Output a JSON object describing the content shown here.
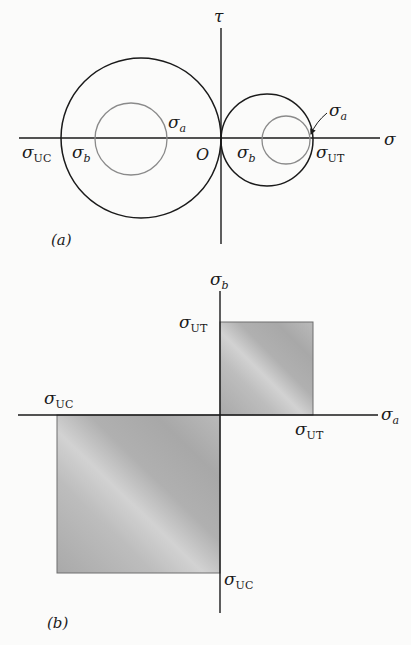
{
  "part_a": {
    "caption": "(a)",
    "axis_vertical_label": "τ",
    "axis_horizontal_label": "σ",
    "origin_label": "O",
    "labels": {
      "sigma_uc": {
        "base": "σ",
        "sub": "UC"
      },
      "sigma_b_left": {
        "base": "σ",
        "sub": "b"
      },
      "sigma_a_left": {
        "base": "σ",
        "sub": "a"
      },
      "sigma_b_right": {
        "base": "σ",
        "sub": "b"
      },
      "sigma_a_right": {
        "base": "σ",
        "sub": "a"
      },
      "sigma_ut": {
        "base": "σ",
        "sub": "UT"
      }
    },
    "circles": [
      {
        "name": "compressive-limit-circle",
        "cx": 141,
        "cy": 138,
        "r": 80,
        "color": "#1a1a1a"
      },
      {
        "name": "compressive-stress-circle",
        "cx": 131,
        "cy": 139,
        "r": 36,
        "color": "#8a8a8a"
      },
      {
        "name": "tensile-limit-circle",
        "cx": 267,
        "cy": 140,
        "r": 46,
        "color": "#1a1a1a"
      },
      {
        "name": "tensile-stress-circle",
        "cx": 286,
        "cy": 140,
        "r": 24,
        "color": "#8a8a8a"
      }
    ]
  },
  "part_b": {
    "caption": "(b)",
    "axis_vertical_label": {
      "base": "σ",
      "sub": "b"
    },
    "axis_horizontal_label": {
      "base": "σ",
      "sub": "a"
    },
    "labels": {
      "sigma_ut_vertical": {
        "base": "σ",
        "sub": "UT"
      },
      "sigma_ut_horizontal": {
        "base": "σ",
        "sub": "UT"
      },
      "sigma_uc_horizontal": {
        "base": "σ",
        "sub": "UC"
      },
      "sigma_uc_vertical": {
        "base": "σ",
        "sub": "UC"
      }
    },
    "regions": [
      {
        "name": "tensile-safe-region",
        "x": 220,
        "y": 322,
        "w": 93,
        "h": 93
      },
      {
        "name": "compressive-safe-region",
        "x": 57,
        "y": 415,
        "w": 163,
        "h": 158
      }
    ],
    "fill_color": "#b2b2b2",
    "stroke_color": "#6e6e6e"
  }
}
